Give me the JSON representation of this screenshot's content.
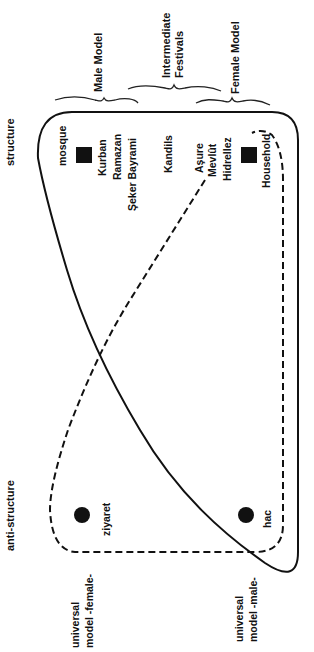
{
  "axis_labels": {
    "structure": "structure",
    "anti_structure": "anti-structure"
  },
  "groups": {
    "male_model": "Male Model",
    "intermediate_line1": "Intermediate",
    "intermediate_line2": "Festivals",
    "female_model": "Female Model"
  },
  "structure_items": {
    "mosque": "mosque",
    "kurban": "Kurban",
    "ramazan": "Ramazan",
    "seker_bayrami": "Şeker  Bayrami",
    "kandils": "Kandils",
    "asure": "Aşure",
    "mevlut": "Mevlût",
    "hidrellez": "Hidrellez",
    "household": "Household"
  },
  "anti_structure_items": {
    "ziyaret": "ziyaret",
    "hac": "hac"
  },
  "universal_labels": {
    "female_line1": "universal",
    "female_line2": "model  -female-",
    "male_line1": "universal",
    "male_line2": "model  -male-"
  },
  "colors": {
    "ink": "#111111",
    "background": "#ffffff"
  }
}
